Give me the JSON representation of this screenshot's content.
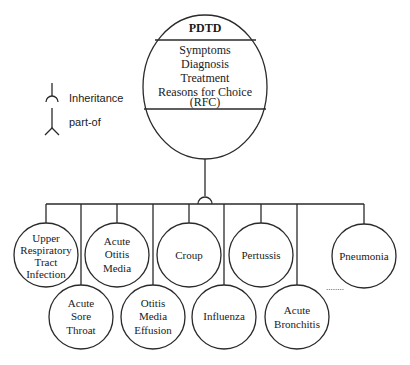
{
  "diagram": {
    "root": {
      "title": "PDTD",
      "attributes": [
        "Symptoms",
        "Diagnosis",
        "Treatment",
        "Reasons for Choice",
        "(RFC)"
      ]
    },
    "legend": {
      "inheritance_label": "Inheritance",
      "partof_label": "part-of"
    },
    "children": [
      {
        "lines": [
          "Upper",
          "Respiratory",
          "Tract",
          "Infection"
        ]
      },
      {
        "lines": [
          "Acute",
          "Sore",
          "Throat"
        ]
      },
      {
        "lines": [
          "Acute",
          "Otitis",
          "Media"
        ]
      },
      {
        "lines": [
          "Otitis",
          "Media",
          "Effusion"
        ]
      },
      {
        "lines": [
          "Croup"
        ]
      },
      {
        "lines": [
          "Influenza"
        ]
      },
      {
        "lines": [
          "Pertussis"
        ]
      },
      {
        "lines": [
          "Acute",
          "Bronchitis"
        ]
      },
      {
        "lines": [
          "Pneumonia"
        ]
      }
    ],
    "ellipsis": "........",
    "colors": {
      "line": "#2a2a2a",
      "background": "#ffffff",
      "text": "#1a1a1a"
    }
  }
}
